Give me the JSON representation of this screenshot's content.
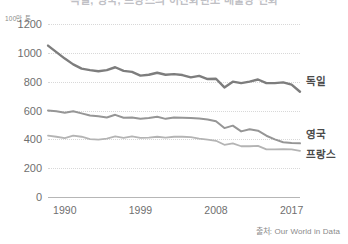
{
  "title": "독일, 영국, 프랑스의 이산화탄소 배출량 변화",
  "source_note": "출처: Our World in Data",
  "y_unit_label": "100만 톤",
  "axis": {
    "y_ticks": [
      "1200",
      "1000",
      "800",
      "600",
      "400",
      "200",
      "0"
    ],
    "x_ticks": [
      "1990",
      "1999",
      "2008",
      "2017"
    ]
  },
  "series_labels": {
    "germany": "독일",
    "uk": "영국",
    "france": "프랑스"
  },
  "colors": {
    "germany": "#7d7d7d",
    "uk": "#969696",
    "france": "#b4b4b4",
    "grid": "#d8d8d8",
    "axis": "#b6b6b6",
    "text": "#6f6f6f"
  },
  "chart_data": {
    "type": "line",
    "title": "독일, 영국, 프랑스의 이산화탄소 배출량 변화",
    "xlabel": "",
    "ylabel": "100만 톤",
    "ylim": [
      0,
      1200
    ],
    "xlim": [
      1988,
      2018
    ],
    "grid": true,
    "legend": "right-inline-labels",
    "x": [
      1988,
      1989,
      1990,
      1991,
      1992,
      1993,
      1994,
      1995,
      1996,
      1997,
      1998,
      1999,
      2000,
      2001,
      2002,
      2003,
      2004,
      2005,
      2006,
      2007,
      2008,
      2009,
      2010,
      2011,
      2012,
      2013,
      2014,
      2015,
      2016,
      2017,
      2018
    ],
    "x_tick_values": [
      1990,
      1999,
      2008,
      2017
    ],
    "y_tick_values": [
      0,
      200,
      400,
      600,
      800,
      1000,
      1200
    ],
    "series": [
      {
        "name": "독일",
        "color": "#7d7d7d",
        "values": [
          1050,
          1005,
          960,
          920,
          890,
          880,
          872,
          880,
          900,
          875,
          868,
          842,
          848,
          862,
          848,
          852,
          846,
          830,
          840,
          818,
          820,
          760,
          800,
          790,
          800,
          815,
          790,
          790,
          795,
          780,
          730
        ]
      },
      {
        "name": "영국",
        "color": "#969696",
        "values": [
          600,
          595,
          585,
          595,
          580,
          565,
          560,
          552,
          570,
          550,
          552,
          542,
          548,
          556,
          542,
          552,
          550,
          548,
          545,
          538,
          525,
          478,
          495,
          455,
          470,
          460,
          425,
          400,
          380,
          375,
          372
        ]
      },
      {
        "name": "프랑스",
        "color": "#b4b4b4",
        "values": [
          425,
          418,
          408,
          425,
          418,
          402,
          398,
          405,
          420,
          410,
          420,
          410,
          412,
          418,
          412,
          418,
          418,
          415,
          405,
          398,
          390,
          362,
          372,
          352,
          352,
          355,
          330,
          330,
          332,
          330,
          320
        ]
      }
    ]
  }
}
